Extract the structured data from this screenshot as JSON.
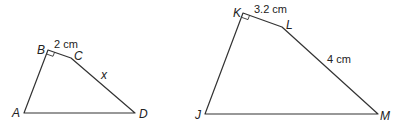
{
  "diagram": {
    "type": "similar-quadrilaterals",
    "stroke_color": "#333333",
    "background": "#ffffff",
    "figures": [
      {
        "name": "ABCD",
        "vertices": [
          {
            "label": "A",
            "x": 24,
            "y": 113
          },
          {
            "label": "B",
            "x": 48,
            "y": 50
          },
          {
            "label": "C",
            "x": 71,
            "y": 58
          },
          {
            "label": "D",
            "x": 135,
            "y": 113
          }
        ],
        "right_angle_at": "B",
        "side_labels": [
          {
            "side": "BC",
            "text": "2 cm"
          },
          {
            "side": "CD",
            "text": "x"
          }
        ]
      },
      {
        "name": "JKLM",
        "vertices": [
          {
            "label": "J",
            "x": 205,
            "y": 114
          },
          {
            "label": "K",
            "x": 243,
            "y": 13
          },
          {
            "label": "L",
            "x": 282,
            "y": 27
          },
          {
            "label": "M",
            "x": 378,
            "y": 114
          }
        ],
        "right_angle_at": "K",
        "side_labels": [
          {
            "side": "KL",
            "text": "3.2 cm"
          },
          {
            "side": "LM",
            "text": "4 cm"
          }
        ]
      }
    ]
  }
}
